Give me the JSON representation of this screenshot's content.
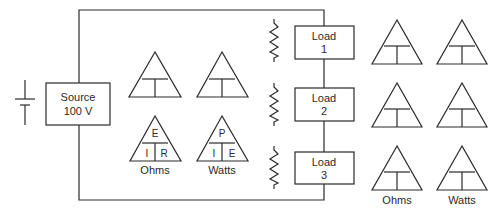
{
  "source": {
    "line1": "Source",
    "line2": "100 V"
  },
  "loads": [
    {
      "line1": "Load",
      "line2": "1"
    },
    {
      "line1": "Load",
      "line2": "2"
    },
    {
      "line1": "Load",
      "line2": "3"
    }
  ],
  "left_triangles": {
    "blank_row": [
      {
        "top": "",
        "left": "",
        "right": ""
      },
      {
        "top": "",
        "left": "",
        "right": ""
      }
    ],
    "ohms": {
      "top": "E",
      "left": "I",
      "right": "R",
      "label": "Ohms"
    },
    "watts": {
      "top": "P",
      "left": "I",
      "right": "E",
      "label": "Watts"
    }
  },
  "right_triangles": {
    "column_labels": [
      "Ohms",
      "Watts"
    ],
    "rows": 3
  },
  "colors": {
    "line": "#2a2a2a",
    "background": "#ffffff"
  }
}
